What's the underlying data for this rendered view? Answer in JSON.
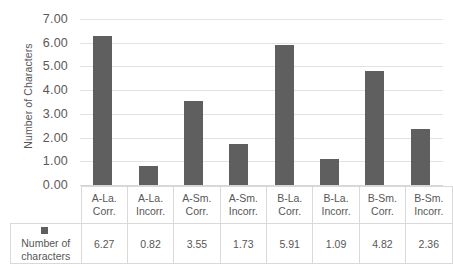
{
  "chart_data": {
    "type": "bar",
    "title": "",
    "xlabel": "",
    "ylabel": "Number of Characters",
    "ylim": [
      0,
      7
    ],
    "ytick_labels": [
      "7.00",
      "6.00",
      "5.00",
      "4.00",
      "3.00",
      "2.00",
      "1.00",
      "0.00"
    ],
    "ytick_values": [
      7,
      6,
      5,
      4,
      3,
      2,
      1,
      0
    ],
    "grid": true,
    "legend_position": "data-table-left",
    "categories": [
      "A-La. Corr.",
      "A-La. Incorr.",
      "A-Sm. Corr.",
      "A-Sm. Incorr.",
      "B-La. Corr.",
      "B-La. Incorr.",
      "B-Sm. Corr.",
      "B-Sm. Incorr."
    ],
    "category_lines": [
      {
        "line1": "A-La.",
        "line2": "Corr."
      },
      {
        "line1": "A-La.",
        "line2": "Incorr."
      },
      {
        "line1": "A-Sm.",
        "line2": "Corr."
      },
      {
        "line1": "A-Sm.",
        "line2": "Incorr."
      },
      {
        "line1": "B-La.",
        "line2": "Corr."
      },
      {
        "line1": "B-La.",
        "line2": "Incorr."
      },
      {
        "line1": "B-Sm.",
        "line2": "Corr."
      },
      {
        "line1": "B-Sm.",
        "line2": "Incorr."
      }
    ],
    "series": [
      {
        "name": "Number of characters",
        "values": [
          6.27,
          0.82,
          3.55,
          1.73,
          5.91,
          1.09,
          4.82,
          2.36
        ],
        "value_labels": [
          "6.27",
          "0.82",
          "3.55",
          "1.73",
          "5.91",
          "1.09",
          "4.82",
          "2.36"
        ],
        "color": "#5f5f5f"
      }
    ]
  },
  "legend": {
    "line1": "Number of",
    "line2": "characters"
  },
  "colors": {
    "bar": "#5f5f5f",
    "gridline": "#e2e2e2",
    "table_border": "#d9d9d9",
    "text": "#575757",
    "background": "#ffffff"
  }
}
